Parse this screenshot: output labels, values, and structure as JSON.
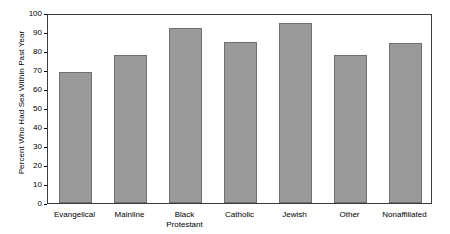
{
  "chart_data": {
    "type": "bar",
    "title": "",
    "xlabel": "",
    "ylabel": "Percent Who Had Sex Within Past Year",
    "categories": [
      "Evangelical",
      "Mainline",
      "Black\nProtestant",
      "Catholic",
      "Jewish",
      "Other",
      "Nonaffiliated"
    ],
    "values": [
      69,
      78,
      92,
      85,
      95,
      78,
      84
    ],
    "ylim": [
      0,
      100
    ],
    "ytick_labels": [
      "0",
      "10",
      "20",
      "30",
      "40",
      "50",
      "60",
      "70",
      "80",
      "90",
      "100"
    ],
    "ytick_values": [
      0,
      10,
      20,
      30,
      40,
      50,
      60,
      70,
      80,
      90,
      100
    ],
    "grid": false,
    "legend": false,
    "bar_color": "#9a9a9a",
    "bar_edge_color": "#6f6f6f",
    "frame_color": "#3b3b3b",
    "background_color": "#ffffff"
  }
}
